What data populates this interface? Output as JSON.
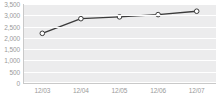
{
  "chart_data": {
    "type": "line",
    "title": "",
    "subtitle": "",
    "xlabel": "",
    "ylabel": "",
    "categories": [
      "12/03",
      "12/04",
      "12/05",
      "12/06",
      "12/07"
    ],
    "values": [
      2200,
      2850,
      2930,
      3030,
      3180
    ],
    "series": [
      {
        "name": "",
        "values": [
          2200,
          2850,
          2930,
          3030,
          3180
        ]
      }
    ],
    "ylim": [
      0,
      3500
    ],
    "yticks": [
      0,
      500,
      1000,
      1500,
      2000,
      2500,
      3000,
      3500
    ],
    "ytick_labels": [
      "0",
      "500",
      "1,000",
      "1,500",
      "2,000",
      "2,500",
      "3,000",
      "3,500"
    ],
    "xtick_labels": [
      "12/03",
      "12/04",
      "12/05",
      "12/06",
      "12/07"
    ],
    "grid": true,
    "grid_orientation": "horizontal",
    "legend": false,
    "legend_position": "none",
    "annotations": [],
    "colors": {
      "plot_background": "#ececed",
      "gridline": "#ffffff",
      "line": "#3b3b3b",
      "marker_fill": "#ffffff",
      "marker_stroke": "#3b3b3b",
      "tick_label": "#9a9a9a",
      "axis_rule": "#c9c9c9",
      "page_background": "#ffffff"
    },
    "marker": "circle"
  }
}
